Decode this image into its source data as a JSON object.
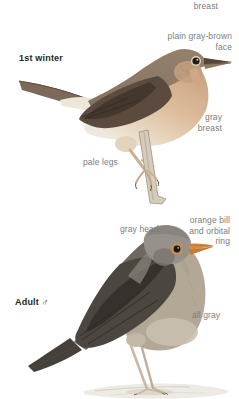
{
  "colors": {
    "background": "#ffffff",
    "label_text": "#7d7d7d",
    "title_text": "#1f1f1f",
    "bill_orange": "#d98c3f",
    "first_winter_upperparts": "#8f7c6a",
    "first_winter_breast": "#d0a884",
    "first_winter_wing": "#5b4b3e",
    "adult_head_gray": "#96928b",
    "adult_wing_dark": "#4c4640",
    "adult_flank": "#b3a795",
    "pale_legs": "#cdb092"
  },
  "first_winter": {
    "title": "1st winter",
    "annotations": {
      "breast_partial": "breast",
      "face": "plain gray-brown face",
      "breast": "gray breast",
      "legs": "pale legs"
    }
  },
  "adult": {
    "title": "Adult ♂",
    "annotations": {
      "head": "gray head",
      "bill": "orange bill and orbital ring",
      "body": "all gray"
    }
  }
}
